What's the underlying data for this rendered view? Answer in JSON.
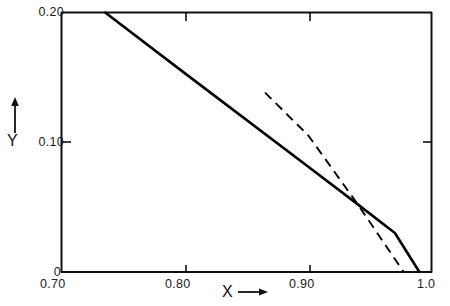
{
  "chart_data": {
    "type": "line",
    "title": "",
    "xlabel": "X",
    "ylabel": "Y",
    "xlim": [
      0.7,
      1.0
    ],
    "ylim": [
      0.0,
      0.2
    ],
    "grid": false,
    "legend": "none",
    "x_ticks": [
      0.7,
      0.8,
      0.9,
      1.0
    ],
    "x_tick_labels": [
      "0.70",
      "0.80",
      "0.90",
      "1.0"
    ],
    "y_ticks": [
      0.0,
      0.1,
      0.2
    ],
    "y_tick_labels": [
      "0",
      "0.10",
      "0.20"
    ],
    "series": [
      {
        "name": "solid-curve",
        "style": "solid",
        "color": "#000000",
        "x": [
          0.7352,
          1.0,
          1.0
        ],
        "y": [
          0.2,
          0.01,
          0.0
        ],
        "points": [
          {
            "x": 0.7352,
            "y": 0.2
          },
          {
            "x": 0.8,
            "y": 0.153
          },
          {
            "x": 0.9,
            "y": 0.081
          },
          {
            "x": 0.94,
            "y": 0.052
          },
          {
            "x": 0.97,
            "y": 0.03
          },
          {
            "x": 0.9898,
            "y": 0.0
          }
        ]
      },
      {
        "name": "dashed-curve",
        "style": "dashed",
        "color": "#000000",
        "x": [
          0.865,
          0.9771
        ],
        "y": [
          0.138,
          0.0
        ],
        "points": [
          {
            "x": 0.865,
            "y": 0.138
          },
          {
            "x": 0.9,
            "y": 0.105
          },
          {
            "x": 0.94,
            "y": 0.052
          },
          {
            "x": 0.9771,
            "y": 0.0
          }
        ]
      }
    ],
    "annotations": [
      {
        "name": "x-axis-arrow",
        "text": "→",
        "near": "X"
      },
      {
        "name": "y-axis-arrow",
        "text": "↑",
        "near": "Y"
      }
    ]
  },
  "axes": {
    "y_labels": {
      "top": "0.20",
      "middle": "0.10",
      "bottom": "0"
    },
    "x_labels": {
      "left": "0.70",
      "mid_left": "0.80",
      "mid_right": "0.90",
      "right": "1.0"
    },
    "titles": {
      "x": "X",
      "y": "Y"
    },
    "arrows": {
      "x": "→",
      "y": "↑"
    }
  },
  "style": {
    "ink": "#000000",
    "background": "#ffffff",
    "frame_color": "#111111"
  }
}
